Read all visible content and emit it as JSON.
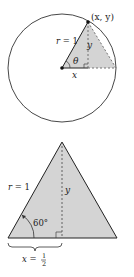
{
  "top_figure": {
    "point_label": "(x, y)",
    "radius_label_var": "r",
    "radius_label_eq": " = 1",
    "y_label": "y",
    "theta_label": "θ",
    "x_label": "x"
  },
  "bottom_figure": {
    "radius_label_var": "r",
    "radius_label_eq": " = 1",
    "y_label": "y",
    "angle_label": "60°",
    "x_label_var": "x",
    "x_label_eq": " = ",
    "frac_num": "1",
    "frac_den": "2"
  },
  "colors": {
    "fill": "#d4d4d4",
    "stroke": "#222222"
  }
}
